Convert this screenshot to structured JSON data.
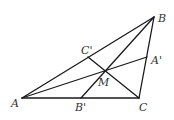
{
  "figure": {
    "stroke_color": "#1a1a1a",
    "label_color": "#333333",
    "points": {
      "A": {
        "label": "A",
        "x": 22,
        "y": 98,
        "lx": 11,
        "ly": 107
      },
      "B": {
        "label": "B",
        "x": 154,
        "y": 17,
        "lx": 158,
        "ly": 22
      },
      "C": {
        "label": "C",
        "x": 139,
        "y": 98,
        "lx": 139,
        "ly": 111
      },
      "A1": {
        "label": "A'",
        "x": 147,
        "y": 57,
        "lx": 151,
        "ly": 64
      },
      "B1": {
        "label": "B'",
        "x": 81,
        "y": 98,
        "lx": 75,
        "ly": 111
      },
      "C1": {
        "label": "C'",
        "x": 88,
        "y": 57,
        "lx": 81,
        "ly": 54
      },
      "M": {
        "label": "M",
        "x": 105,
        "y": 71,
        "lx": 98,
        "ly": 86
      }
    },
    "segments": [
      {
        "name": "side-AB",
        "from": "A",
        "to": "B"
      },
      {
        "name": "side-BC",
        "from": "B",
        "to": "C"
      },
      {
        "name": "side-CA",
        "from": "C",
        "to": "A"
      },
      {
        "name": "cevian-AA1",
        "from": "A",
        "to": "A1"
      },
      {
        "name": "cevian-BB1",
        "from": "B",
        "to": "B1"
      },
      {
        "name": "cevian-CC1",
        "from": "C",
        "to": "C1"
      }
    ]
  }
}
